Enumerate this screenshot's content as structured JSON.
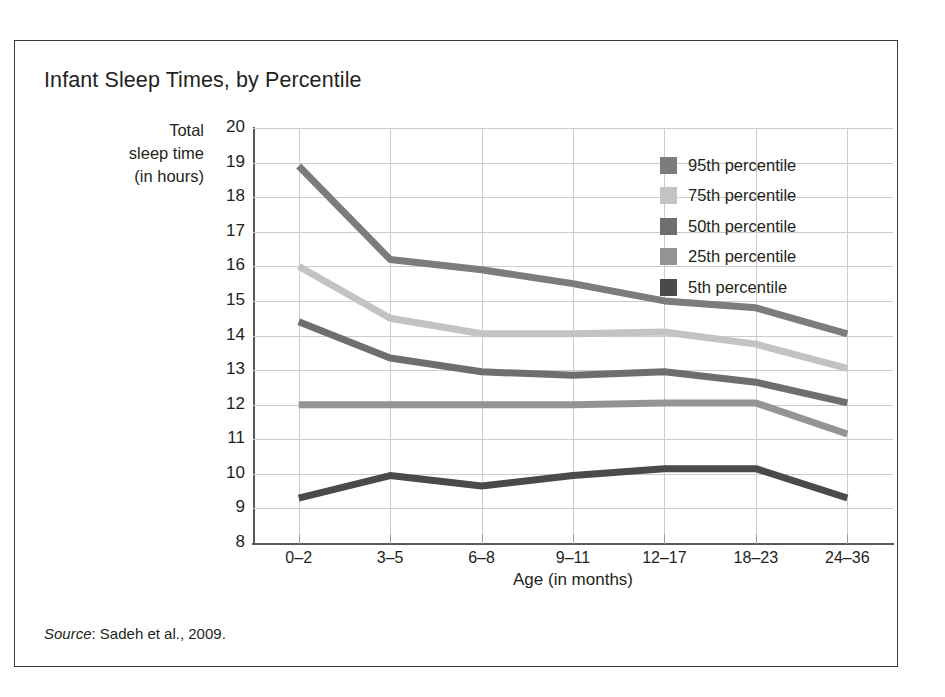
{
  "chart_data": {
    "type": "line",
    "title": "Infant Sleep Times, by Percentile",
    "xlabel": "Age (in months)",
    "ylabel": "Total sleep time (in hours)",
    "ylabel_lines": [
      "Total",
      "sleep time",
      "(in hours)"
    ],
    "categories": [
      "0–2",
      "3–5",
      "6–8",
      "9–11",
      "12–17",
      "18–23",
      "24–36"
    ],
    "ylim": [
      8,
      20
    ],
    "yticks": [
      20,
      19,
      18,
      17,
      16,
      15,
      14,
      13,
      12,
      11,
      10,
      9,
      8
    ],
    "grid": true,
    "legend_position": "inside-top-right",
    "series": [
      {
        "name": "95th percentile",
        "color": "#7c7c7c",
        "values": [
          18.9,
          16.2,
          15.9,
          15.5,
          15.0,
          14.8,
          14.05
        ]
      },
      {
        "name": "75th percentile",
        "color": "#c3c3c3",
        "values": [
          16.0,
          14.5,
          14.05,
          14.05,
          14.1,
          13.75,
          13.05
        ]
      },
      {
        "name": "50th percentile",
        "color": "#6e6e6e",
        "values": [
          14.4,
          13.35,
          12.95,
          12.85,
          12.95,
          12.65,
          12.05
        ]
      },
      {
        "name": "25th percentile",
        "color": "#949494",
        "values": [
          12.0,
          12.0,
          12.0,
          12.0,
          12.05,
          12.05,
          11.15
        ]
      },
      {
        "name": "5th percentile",
        "color": "#4a4a4a",
        "values": [
          9.3,
          9.95,
          9.65,
          9.95,
          10.15,
          10.15,
          9.3
        ]
      }
    ]
  },
  "source_note": {
    "label": "Source",
    "text": ": Sadeh et al., 2009."
  }
}
